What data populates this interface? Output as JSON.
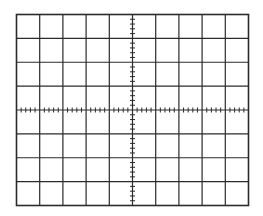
{
  "graticule": {
    "description": "Oscilloscope graticule",
    "divisions_x": 10,
    "divisions_y": 8,
    "minor_ticks_per_division": 5,
    "left": 16.5,
    "top": 14.5,
    "right": 248.5,
    "bottom": 205.5,
    "line_color": "#2b2b2b",
    "background_color": "#ffffff"
  }
}
